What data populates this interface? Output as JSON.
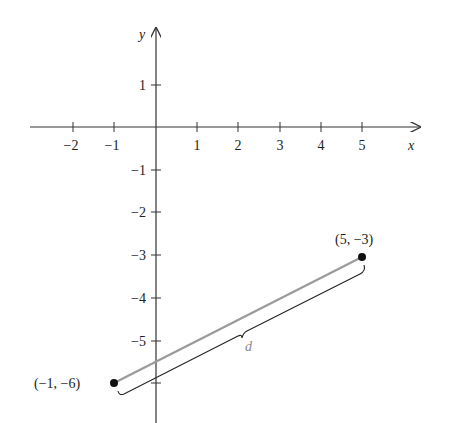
{
  "diagram": {
    "type": "coordinate-plane-distance",
    "axes": {
      "x_label": "x",
      "y_label": "y",
      "x_ticks": [
        {
          "value": -2,
          "label": "−2"
        },
        {
          "value": -1,
          "label": "−1"
        },
        {
          "value": 1,
          "label": "1"
        },
        {
          "value": 2,
          "label": "2"
        },
        {
          "value": 3,
          "label": "3"
        },
        {
          "value": 4,
          "label": "4"
        },
        {
          "value": 5,
          "label": "5"
        }
      ],
      "y_ticks": [
        {
          "value": 1,
          "label": "1"
        },
        {
          "value": -1,
          "label": "−1"
        },
        {
          "value": -2,
          "label": "−2"
        },
        {
          "value": -3,
          "label": "−3"
        },
        {
          "value": -4,
          "label": "−4"
        },
        {
          "value": -5,
          "label": "−5"
        },
        {
          "value": -6,
          "label": ""
        }
      ]
    },
    "points": [
      {
        "x": -1,
        "y": -6,
        "label": "(−1, −6)"
      },
      {
        "x": 5,
        "y": -3,
        "label": "(5, −3)"
      }
    ],
    "segment_label": "d",
    "colors": {
      "axis": "#333333",
      "segment": "#999999",
      "brace": "#222222",
      "point": "#111111",
      "label_d": "#888888"
    }
  }
}
